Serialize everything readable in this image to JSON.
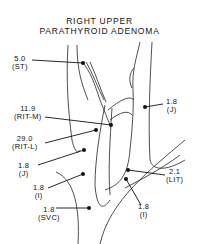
{
  "title": {
    "line1": "RIGHT UPPER",
    "line2": "PARATHYROID ADENOMA"
  },
  "samples": [
    {
      "value": "5.0",
      "site": "(ST)"
    },
    {
      "value": "11.9",
      "site": "(RIT-M)"
    },
    {
      "value": "29.0",
      "site": "(RIT-L)"
    },
    {
      "value": "1.8",
      "site": "(J)"
    },
    {
      "value": "1.8",
      "site": "(J)"
    },
    {
      "value": "2.1",
      "site": "(LIT)"
    },
    {
      "value": "1.8",
      "site": "(I)"
    },
    {
      "value": "1.8",
      "site": "(I)"
    },
    {
      "value": "1.8",
      "site": "(SVC)"
    }
  ]
}
